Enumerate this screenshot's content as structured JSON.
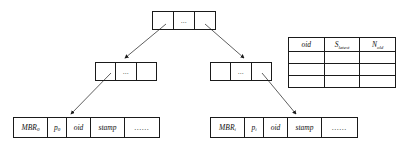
{
  "diagram": {
    "root": {
      "name": "root-node",
      "cells": [
        "",
        "...",
        ""
      ]
    },
    "intermediate_nodes": [
      {
        "name": "intermediate-node-left",
        "cells": [
          "",
          "...",
          ""
        ]
      },
      {
        "name": "intermediate-node-right",
        "cells": [
          "",
          "...",
          ""
        ]
      }
    ],
    "leaf_nodes": [
      {
        "name": "leaf-node-left",
        "cells": [
          {
            "label": "MBR",
            "sub": "0"
          },
          {
            "label": "p",
            "sub": "0"
          },
          {
            "label": "oid",
            "sub": ""
          },
          {
            "label": "stamp",
            "sub": ""
          },
          {
            "label": "......",
            "sub": ""
          }
        ]
      },
      {
        "name": "leaf-node-right",
        "cells": [
          {
            "label": "MBR",
            "sub": "i"
          },
          {
            "label": "p",
            "sub": "i"
          },
          {
            "label": "oid",
            "sub": ""
          },
          {
            "label": "stamp",
            "sub": ""
          },
          {
            "label": "......",
            "sub": ""
          }
        ]
      }
    ],
    "side_table": {
      "name": "object-history-table",
      "headers": [
        {
          "label": "oid",
          "sub": ""
        },
        {
          "label": "S",
          "sub": "latest"
        },
        {
          "label": "N",
          "sub": "old"
        }
      ],
      "rows": [
        [
          "",
          "",
          ""
        ],
        [
          "",
          "",
          ""
        ],
        [
          "",
          "",
          ""
        ]
      ]
    },
    "connectors": [
      {
        "name": "arrow-root-to-left-intermediate",
        "from": "root-cell-1",
        "to": "intermediate-node-left"
      },
      {
        "name": "arrow-root-to-right-intermediate",
        "from": "root-cell-3",
        "to": "intermediate-node-right"
      },
      {
        "name": "arrow-left-intermediate-to-left-leaf",
        "from": "intermediate-node-left",
        "to": "leaf-node-left-oid"
      },
      {
        "name": "arrow-right-intermediate-to-right-leaf",
        "from": "intermediate-node-right",
        "to": "leaf-node-right-stamp"
      }
    ],
    "colors": {
      "line": "#1a1a1a",
      "background": "#ffffff",
      "text": "#111111"
    }
  }
}
